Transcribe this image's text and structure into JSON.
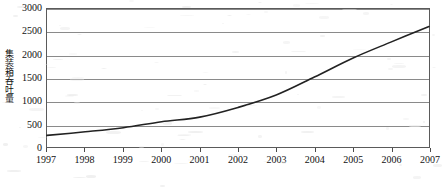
{
  "chart_data": {
    "type": "line",
    "title": "",
    "subtitle": "",
    "xlabel": "",
    "ylabel": "集装箱吞吐量",
    "x": [
      1997,
      1998,
      1999,
      2000,
      2001,
      2002,
      2003,
      2004,
      2005,
      2006,
      2007
    ],
    "xtick_labels": [
      "1997",
      "1998",
      "1999",
      "2000",
      "2001",
      "2002",
      "2003",
      "2004",
      "2005",
      "2006",
      "2007"
    ],
    "ytick_labels": [
      "0",
      "500",
      "1000",
      "1500",
      "2000",
      "2500",
      "3000"
    ],
    "ytick_values": [
      0,
      500,
      1000,
      1500,
      2000,
      2500,
      3000
    ],
    "ylim": [
      0,
      3000
    ],
    "xlim": [
      1997,
      2007
    ],
    "grid": true,
    "grid_axis": "y",
    "legend": false,
    "legend_position": "none",
    "line_color": "#222222",
    "line_width": 1.6,
    "markers": false,
    "series": [
      {
        "name": "集装箱吞吐量",
        "values": [
          252,
          330,
          420,
          550,
          650,
          860,
          1130,
          1520,
          1930,
          2280,
          2620
        ]
      }
    ]
  },
  "axes": {
    "y_axis_title": "集装箱吞吐量",
    "y_ticks": [
      "3000",
      "2500",
      "2000",
      "1500",
      "1000",
      "500",
      "0"
    ],
    "x_ticks": [
      "1997",
      "1998",
      "1999",
      "2000",
      "2001",
      "2002",
      "2003",
      "2004",
      "2005",
      "2006",
      "2007"
    ]
  },
  "style": {
    "frame_color": "#5a5a5a",
    "grid_color": "#8a8a8a",
    "text_color": "#111111",
    "background": "#ffffff"
  }
}
